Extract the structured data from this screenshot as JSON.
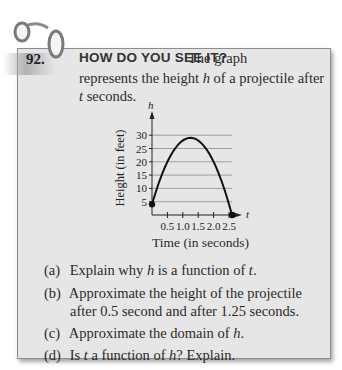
{
  "exercise": {
    "number": "92.",
    "heading": "HOW DO YOU SEE IT?",
    "intro_line1": "The graph",
    "intro_line2_pre": "represents the height ",
    "intro_line2_var": "h",
    "intro_line2_post": " of a projectile after",
    "intro_line3_var": "t",
    "intro_line3_post": " seconds."
  },
  "questions": [
    {
      "label": "(a)",
      "pre": "Explain why ",
      "v1": "h",
      "mid": " is a function of ",
      "v2": "t",
      "post": "."
    },
    {
      "label": "(b)",
      "line1": "Approximate the height of the projectile",
      "line2": "after 0.5 second and after 1.25 seconds."
    },
    {
      "label": "(c)",
      "pre": "Approximate the domain of ",
      "v1": "h",
      "post": "."
    },
    {
      "label": "(d)",
      "pre": "Is ",
      "v1": "t",
      "mid": " a function of ",
      "v2": "h",
      "post": "? Explain."
    }
  ],
  "chart_data": {
    "type": "line",
    "title": "",
    "xlabel": "Time (in seconds)",
    "ylabel": "Height (in feet)",
    "x_axis_var": "t",
    "y_axis_var": "h",
    "xlim": [
      0,
      2.7
    ],
    "ylim": [
      0,
      32
    ],
    "x_ticks": [
      "0.5",
      "1.0",
      "1.5",
      "2.0",
      "2.5"
    ],
    "y_ticks": [
      "5",
      "10",
      "15",
      "20",
      "25",
      "30"
    ],
    "grid": "horizontal",
    "series": [
      {
        "name": "h(t)",
        "x": [
          0,
          0.25,
          0.5,
          0.75,
          1.0,
          1.25,
          1.5,
          1.75,
          2.0,
          2.25,
          2.5,
          2.6
        ],
        "values": [
          4,
          13,
          20,
          25,
          28,
          29,
          28,
          25,
          20,
          13,
          4,
          0
        ]
      }
    ],
    "endpoints": [
      [
        0,
        4
      ],
      [
        2.6,
        0
      ]
    ],
    "approx_model": "h = -16t^2 + 40t + 4"
  }
}
